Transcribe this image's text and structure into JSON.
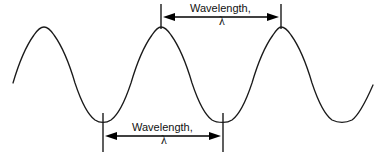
{
  "figure": {
    "type": "wave-diagram",
    "background_color": "#ffffff",
    "stroke_color": "#1a1a1a",
    "width": 385,
    "height": 161
  },
  "wave": {
    "name": "sine-wave",
    "start": {
      "x": 13,
      "y": 83
    },
    "end": {
      "x": 373,
      "y": 85
    },
    "peak_y": 27,
    "trough_y": 122,
    "midline_y": 74.5,
    "amplitude": 47.5,
    "period": 120,
    "peaks": [
      {
        "x": 44,
        "y": 27
      },
      {
        "x": 161,
        "y": 27
      },
      {
        "x": 281,
        "y": 27
      }
    ],
    "troughs": [
      {
        "x": 103,
        "y": 122
      },
      {
        "x": 223,
        "y": 122
      },
      {
        "x": 342,
        "y": 122
      }
    ]
  },
  "annotations": {
    "top": {
      "label": "Wavelength,",
      "symbol": "λ",
      "measures": "crest-to-crest",
      "arrow_y": 17,
      "left_x": 161,
      "right_x": 281,
      "tick_top_y": 4,
      "tick_bottom_y": 29
    },
    "bottom": {
      "label": "Wavelength,",
      "symbol": "λ",
      "measures": "trough-to-trough",
      "arrow_y": 136,
      "left_x": 103,
      "right_x": 223,
      "tick_top_y": 113,
      "tick_bottom_y": 152
    }
  }
}
